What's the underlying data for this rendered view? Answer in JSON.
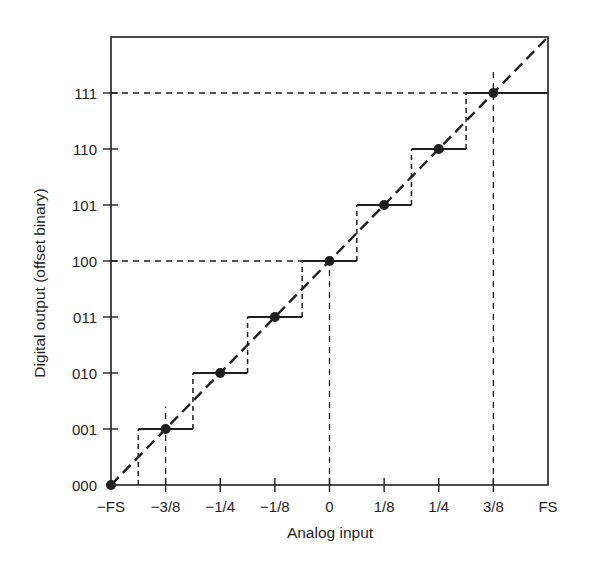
{
  "chart_data": {
    "type": "line",
    "subtype": "step-transfer-function",
    "title": "",
    "xlabel": "Analog input",
    "ylabel": "Digital output (offset binary)",
    "x_ticks": [
      "−FS",
      "−3/8",
      "−1/4",
      "−1/8",
      "0",
      "1/8",
      "1/4",
      "3/8",
      "FS"
    ],
    "x_tick_values": [
      -0.5,
      -0.375,
      -0.25,
      -0.125,
      0,
      0.125,
      0.25,
      0.375,
      0.5
    ],
    "y_ticks": [
      "000",
      "001",
      "010",
      "011",
      "100",
      "101",
      "110",
      "111"
    ],
    "y_tick_values": [
      0,
      1,
      2,
      3,
      4,
      5,
      6,
      7
    ],
    "xlim": [
      -0.5,
      0.5
    ],
    "ylim": [
      0,
      8
    ],
    "grid": false,
    "legend": null,
    "series": [
      {
        "name": "Quantized output (staircase)",
        "style": "solid step",
        "x": [
          -0.5,
          -0.375,
          -0.25,
          -0.125,
          0,
          0.125,
          0.25,
          0.375
        ],
        "y": [
          0,
          1,
          2,
          3,
          4,
          5,
          6,
          7
        ],
        "code_labels": [
          "000",
          "001",
          "010",
          "011",
          "100",
          "101",
          "110",
          "111"
        ],
        "step_half_width": 0.0625,
        "markers": "filled circles at code centers"
      },
      {
        "name": "Ideal transfer line",
        "style": "dashed",
        "x": [
          -0.5,
          0.5
        ],
        "y": [
          0,
          8
        ]
      }
    ],
    "reference_lines": [
      {
        "orientation": "horizontal",
        "y": 7,
        "label": "111",
        "x_end": 0.3125,
        "style": "dashed"
      },
      {
        "orientation": "horizontal",
        "y": 4,
        "label": "100",
        "x_end": -0.0625,
        "style": "dashed"
      },
      {
        "orientation": "vertical",
        "x": -0.375,
        "label": "−3/8",
        "y_end": 1.4,
        "style": "dashed"
      },
      {
        "orientation": "vertical",
        "x": 0,
        "label": "0",
        "y_end": 4,
        "style": "dashed"
      },
      {
        "orientation": "vertical",
        "x": 0.375,
        "label": "3/8",
        "y_end": 7.4,
        "style": "dashed"
      }
    ]
  },
  "colors": {
    "ink": "#1f1f1f",
    "background": "#ffffff"
  }
}
